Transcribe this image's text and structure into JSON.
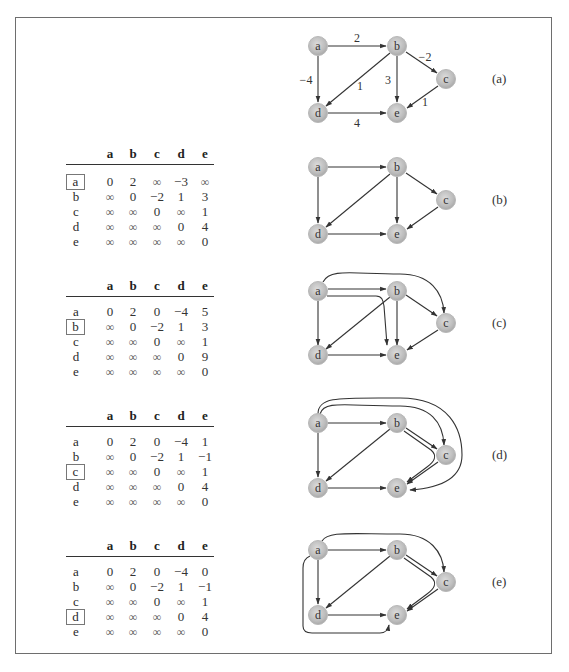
{
  "figure": {
    "node_labels": [
      "a",
      "b",
      "c",
      "d",
      "e"
    ],
    "panels": [
      {
        "id": "a",
        "label": "(a)",
        "edges": [
          {
            "from": "a",
            "to": "b",
            "weight": "2"
          },
          {
            "from": "a",
            "to": "d",
            "weight": "−4"
          },
          {
            "from": "b",
            "to": "c",
            "weight": "−2"
          },
          {
            "from": "b",
            "to": "d",
            "weight": "1"
          },
          {
            "from": "b",
            "to": "e",
            "weight": "3"
          },
          {
            "from": "c",
            "to": "e",
            "weight": "1"
          },
          {
            "from": "d",
            "to": "e",
            "weight": "4"
          }
        ]
      },
      {
        "id": "b",
        "label": "(b)",
        "pivot": "a",
        "table": {
          "columns": [
            "a",
            "b",
            "c",
            "d",
            "e"
          ],
          "rows": [
            {
              "label": "a",
              "values": [
                "0",
                "2",
                "∞",
                "−3",
                "∞"
              ]
            },
            {
              "label": "b",
              "values": [
                "∞",
                "0",
                "−2",
                "1",
                "3"
              ]
            },
            {
              "label": "c",
              "values": [
                "∞",
                "∞",
                "0",
                "∞",
                "1"
              ]
            },
            {
              "label": "d",
              "values": [
                "∞",
                "∞",
                "∞",
                "0",
                "4"
              ]
            },
            {
              "label": "e",
              "values": [
                "∞",
                "∞",
                "∞",
                "∞",
                "0"
              ]
            }
          ]
        }
      },
      {
        "id": "c",
        "label": "(c)",
        "pivot": "b",
        "table": {
          "columns": [
            "a",
            "b",
            "c",
            "d",
            "e"
          ],
          "rows": [
            {
              "label": "a",
              "values": [
                "0",
                "2",
                "0",
                "−4",
                "5"
              ]
            },
            {
              "label": "b",
              "values": [
                "∞",
                "0",
                "−2",
                "1",
                "3"
              ]
            },
            {
              "label": "c",
              "values": [
                "∞",
                "∞",
                "0",
                "∞",
                "1"
              ]
            },
            {
              "label": "d",
              "values": [
                "∞",
                "∞",
                "∞",
                "0",
                "9"
              ]
            },
            {
              "label": "e",
              "values": [
                "∞",
                "∞",
                "∞",
                "∞",
                "0"
              ]
            }
          ]
        }
      },
      {
        "id": "d",
        "label": "(d)",
        "pivot": "c",
        "table": {
          "columns": [
            "a",
            "b",
            "c",
            "d",
            "e"
          ],
          "rows": [
            {
              "label": "a",
              "values": [
                "0",
                "2",
                "0",
                "−4",
                "1"
              ]
            },
            {
              "label": "b",
              "values": [
                "∞",
                "0",
                "−2",
                "1",
                "−1"
              ]
            },
            {
              "label": "c",
              "values": [
                "∞",
                "∞",
                "0",
                "∞",
                "1"
              ]
            },
            {
              "label": "d",
              "values": [
                "∞",
                "∞",
                "∞",
                "0",
                "4"
              ]
            },
            {
              "label": "e",
              "values": [
                "∞",
                "∞",
                "∞",
                "∞",
                "0"
              ]
            }
          ]
        }
      },
      {
        "id": "e",
        "label": "(e)",
        "pivot": "d",
        "table": {
          "columns": [
            "a",
            "b",
            "c",
            "d",
            "e"
          ],
          "rows": [
            {
              "label": "a",
              "values": [
                "0",
                "2",
                "0",
                "−4",
                "0"
              ]
            },
            {
              "label": "b",
              "values": [
                "∞",
                "0",
                "−2",
                "1",
                "−1"
              ]
            },
            {
              "label": "c",
              "values": [
                "∞",
                "∞",
                "0",
                "∞",
                "1"
              ]
            },
            {
              "label": "d",
              "values": [
                "∞",
                "∞",
                "∞",
                "0",
                "4"
              ]
            },
            {
              "label": "e",
              "values": [
                "∞",
                "∞",
                "∞",
                "∞",
                "0"
              ]
            }
          ]
        }
      }
    ]
  }
}
